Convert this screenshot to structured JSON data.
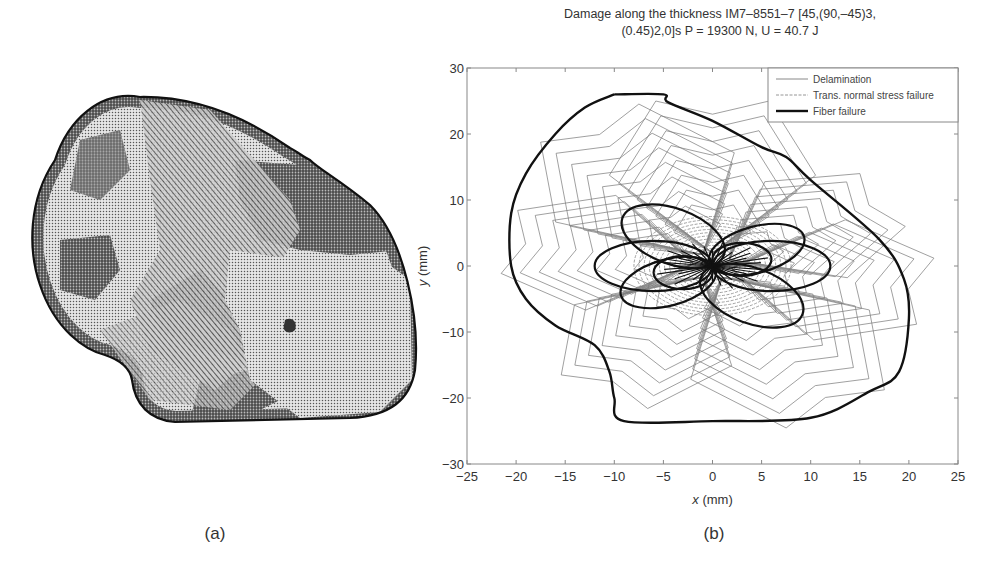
{
  "figure": {
    "panel_a": {
      "caption": "(a)",
      "description": "C-scan style damage map of impacted laminate: stippled/hatched irregular damage region with black outline"
    },
    "panel_b": {
      "caption": "(b)",
      "title_line1": "Damage along the thickness IM7–8551–7 [45,(90,–45)3,",
      "title_line2": "(0.45)2,0]s P = 19300 N, U = 40.7 J"
    }
  },
  "chart_data": {
    "type": "line",
    "xlabel": "x (mm)",
    "ylabel": "y (mm)",
    "xlim": [
      -25,
      25
    ],
    "ylim": [
      -30,
      30
    ],
    "xticks": [
      -25,
      -20,
      -15,
      -10,
      -5,
      0,
      5,
      10,
      15,
      20,
      25
    ],
    "yticks": [
      -30,
      -20,
      -10,
      0,
      10,
      20,
      30
    ],
    "grid": false,
    "legend_position": "upper right",
    "legend": [
      {
        "label": "Delamination",
        "style": "thin solid gray"
      },
      {
        "label": "Trans. normal stress failure",
        "style": "thin dashed gray"
      },
      {
        "label": "Fiber failure",
        "style": "thick solid black"
      }
    ],
    "series": [
      {
        "name": "Fiber failure (outer envelope)",
        "points": [
          [
            -10,
            26
          ],
          [
            -5,
            26
          ],
          [
            -4.5,
            24.8
          ],
          [
            0,
            22
          ],
          [
            5,
            18
          ],
          [
            7.5,
            16.5
          ],
          [
            10,
            13
          ],
          [
            17,
            4
          ],
          [
            19.5,
            -2
          ],
          [
            20,
            -8
          ],
          [
            19,
            -16
          ],
          [
            16,
            -19
          ],
          [
            10,
            -23
          ],
          [
            0,
            -23.5
          ],
          [
            -9,
            -23.5
          ],
          [
            -10,
            -20
          ],
          [
            -10.5,
            -16
          ],
          [
            -12,
            -12
          ],
          [
            -16,
            -9
          ],
          [
            -19,
            -5
          ],
          [
            -20.5,
            0
          ],
          [
            -20.5,
            8
          ],
          [
            -19,
            14
          ],
          [
            -16,
            20
          ],
          [
            -13,
            24
          ],
          [
            -10,
            26
          ]
        ]
      },
      {
        "name": "Fiber failure (ply lobes)",
        "ellipses": [
          {
            "cx": -4,
            "cy": 4.5,
            "rx": 5.5,
            "ry": 4.2,
            "angle": -20
          },
          {
            "cx": 4,
            "cy": -4.5,
            "rx": 5.5,
            "ry": 4.2,
            "angle": -20
          },
          {
            "cx": 4.5,
            "cy": 2.5,
            "rx": 5,
            "ry": 3.5,
            "angle": 15
          },
          {
            "cx": -4.5,
            "cy": -2.5,
            "rx": 5,
            "ry": 3.5,
            "angle": 15
          },
          {
            "cx": -6,
            "cy": 0,
            "rx": 6,
            "ry": 3.8,
            "angle": 0
          },
          {
            "cx": 6,
            "cy": 0,
            "rx": 6,
            "ry": 3.8,
            "angle": 0
          },
          {
            "cx": -3,
            "cy": -1,
            "rx": 3,
            "ry": 2.5,
            "angle": 0
          },
          {
            "cx": 3,
            "cy": 1,
            "rx": 3,
            "ry": 2.5,
            "angle": 0
          }
        ]
      },
      {
        "name": "Delamination (petal contours)",
        "petals": [
          {
            "angle_deg": 90,
            "reach_mm": 25
          },
          {
            "angle_deg": 30,
            "reach_mm": 20
          },
          {
            "angle_deg": -10,
            "reach_mm": 22
          },
          {
            "angle_deg": -60,
            "reach_mm": 25
          },
          {
            "angle_deg": -120,
            "reach_mm": 22
          },
          {
            "angle_deg": 170,
            "reach_mm": 21
          },
          {
            "angle_deg": 120,
            "reach_mm": 25
          }
        ]
      },
      {
        "name": "Trans. normal stress failure (central ellipse)",
        "ellipses": [
          {
            "cx": 0,
            "cy": 0,
            "rx": 8,
            "ry": 7.5,
            "angle": 0
          }
        ]
      }
    ]
  },
  "colors": {
    "fiber": "#111111",
    "delamination": "#7a7a7a",
    "axis": "#888888",
    "text": "#333333"
  }
}
